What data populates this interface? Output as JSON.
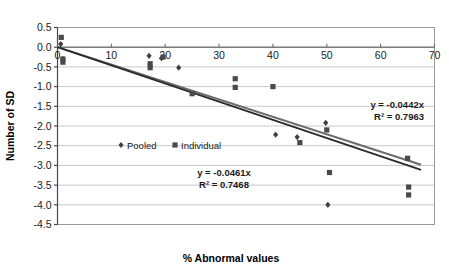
{
  "chart_data": {
    "type": "scatter",
    "title": "",
    "xlabel": "% Abnormal values",
    "ylabel": "Number of SD",
    "xlim": [
      0,
      70
    ],
    "ylim": [
      -4.5,
      0.5
    ],
    "xticks": [
      0,
      10,
      20,
      30,
      40,
      50,
      60,
      70
    ],
    "xtick_labels": [
      "0",
      "10",
      "20",
      "30",
      "40",
      "50",
      "60",
      "70"
    ],
    "yticks": [
      0.5,
      0.0,
      -0.5,
      -1.0,
      -1.5,
      -2.0,
      -2.5,
      -3.0,
      -3.5,
      -4.0,
      -4.5
    ],
    "ytick_labels": [
      "0.5",
      "0.0",
      "-0.5",
      "-1.0",
      "-1.5",
      "-2.0",
      "-2.5",
      "-3.0",
      "-3.5",
      "-4.0",
      "-4.5"
    ],
    "grid": "horizontal",
    "legend_position": "inside-upper-left",
    "series": [
      {
        "name": "Pooled",
        "marker": "diamond",
        "color": "#3f3f3f",
        "points": [
          {
            "x": 0.6,
            "y": 0.08
          },
          {
            "x": 1.0,
            "y": -0.3
          },
          {
            "x": 17.0,
            "y": -0.22
          },
          {
            "x": 19.3,
            "y": -0.28
          },
          {
            "x": 22.5,
            "y": -0.52
          },
          {
            "x": 44.5,
            "y": -2.28
          },
          {
            "x": 49.8,
            "y": -1.92
          },
          {
            "x": 50.2,
            "y": -4.0
          },
          {
            "x": 40.5,
            "y": -2.22
          }
        ]
      },
      {
        "name": "Individual",
        "marker": "square",
        "color": "#4a4a4a",
        "points": [
          {
            "x": 0.7,
            "y": 0.25
          },
          {
            "x": 1.0,
            "y": -0.3
          },
          {
            "x": 1.0,
            "y": -0.38
          },
          {
            "x": 17.2,
            "y": -0.42
          },
          {
            "x": 17.2,
            "y": -0.52
          },
          {
            "x": 19.6,
            "y": -0.25
          },
          {
            "x": 25.0,
            "y": -1.18
          },
          {
            "x": 33.0,
            "y": -0.8
          },
          {
            "x": 33.0,
            "y": -1.02
          },
          {
            "x": 40.0,
            "y": -1.0
          },
          {
            "x": 45.0,
            "y": -2.42
          },
          {
            "x": 50.0,
            "y": -2.1
          },
          {
            "x": 50.5,
            "y": -3.18
          },
          {
            "x": 65.0,
            "y": -2.82
          },
          {
            "x": 65.2,
            "y": -3.55
          },
          {
            "x": 65.2,
            "y": -3.75
          }
        ]
      }
    ],
    "trendlines": [
      {
        "id": "pooled-trendline",
        "equation": "y = -0.0442x",
        "r2": "R² = 0.7963",
        "slope": -0.0442,
        "intercept": 0,
        "color": "#6b6b6b"
      },
      {
        "id": "individual-trendline",
        "equation": "y = -0.0461x",
        "r2": "R² = 0.7468",
        "slope": -0.0461,
        "intercept": 0,
        "color": "#2b2b2b"
      }
    ],
    "annotations": [
      {
        "id": "eq-top",
        "line1": "y = -0.0442x",
        "line2": "R² = 0.7963"
      },
      {
        "id": "eq-bottom",
        "line1": "y = -0.0461x",
        "line2": "R² = 0.7468"
      }
    ]
  },
  "legend": {
    "items": [
      {
        "label": "Pooled",
        "marker": "diamond"
      },
      {
        "label": "Individual",
        "marker": "square"
      }
    ]
  }
}
